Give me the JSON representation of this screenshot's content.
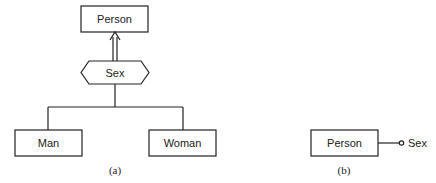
{
  "diagram_a": {
    "caption": "(a)",
    "parent": "Person",
    "discriminator": "Sex",
    "children": [
      "Man",
      "Woman"
    ]
  },
  "diagram_b": {
    "caption": "(b)",
    "entity": "Person",
    "attribute": "Sex"
  },
  "colors": {
    "stroke": "#222222",
    "background": "#ffffff"
  }
}
